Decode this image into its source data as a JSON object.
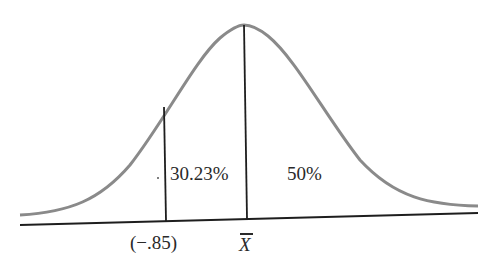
{
  "diagram": {
    "type": "normal-distribution-curve",
    "colors": {
      "curve": "#8a8a8a",
      "lines": "#1e1e1e",
      "text": "#2a2a2a",
      "background": "#ffffff"
    },
    "regions": [
      {
        "label": "30.23%",
        "from": "-.85",
        "to": "mean"
      },
      {
        "label": "50%",
        "from": "mean",
        "to": "+inf"
      }
    ],
    "axis_labels": {
      "z_value": "(−.85)",
      "mean": "X"
    }
  }
}
